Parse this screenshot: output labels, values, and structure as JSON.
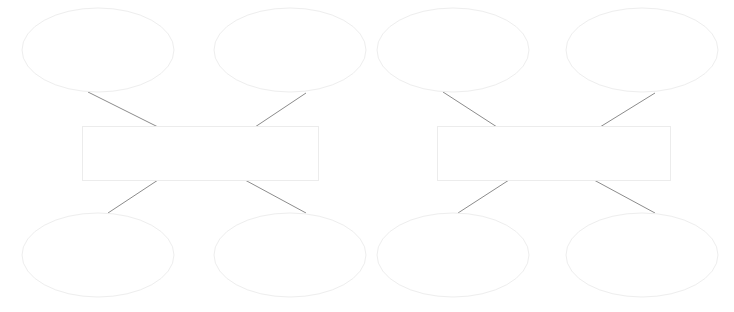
{
  "document": {
    "title": "Blank Concept Map Worksheet",
    "background_color": "#ffffff",
    "width": 734,
    "height": 312
  },
  "style": {
    "ellipse_stroke_color": "#eeeeee",
    "rectangle_stroke_color": "#ececec",
    "connector_stroke_color": "#8c8c8c",
    "shape_fill_color": "#ffffff",
    "stroke_width": 1
  },
  "diagram": {
    "type": "concept-map",
    "group_count": 2,
    "groups": [
      {
        "id": "group-left",
        "center_box": {
          "name": "center-box-left",
          "label": "",
          "x": 82,
          "y": 126,
          "width": 236,
          "height": 54
        },
        "nodes": [
          {
            "name": "ellipse-left-top-1",
            "label": "",
            "cx": 98,
            "cy": 50,
            "rx": 76,
            "ry": 42
          },
          {
            "name": "ellipse-left-top-2",
            "label": "",
            "cx": 290,
            "cy": 50,
            "rx": 76,
            "ry": 42
          },
          {
            "name": "ellipse-left-bottom-1",
            "label": "",
            "cx": 98,
            "cy": 255,
            "rx": 76,
            "ry": 42
          },
          {
            "name": "ellipse-left-bottom-2",
            "label": "",
            "cx": 290,
            "cy": 255,
            "rx": 76,
            "ry": 42
          }
        ],
        "connectors": [
          {
            "name": "connector-left-top-1",
            "x1": 88,
            "y1": 92,
            "x2": 158,
            "y2": 127
          },
          {
            "name": "connector-left-top-2",
            "x1": 255,
            "y1": 127,
            "x2": 306,
            "y2": 93
          },
          {
            "name": "connector-left-bottom-1",
            "x1": 108,
            "y1": 213,
            "x2": 158,
            "y2": 180
          },
          {
            "name": "connector-left-bottom-2",
            "x1": 245,
            "y1": 180,
            "x2": 306,
            "y2": 213
          }
        ]
      },
      {
        "id": "group-right",
        "center_box": {
          "name": "center-box-right",
          "label": "",
          "x": 437,
          "y": 126,
          "width": 233,
          "height": 54
        },
        "nodes": [
          {
            "name": "ellipse-right-top-1",
            "label": "",
            "cx": 453,
            "cy": 50,
            "rx": 76,
            "ry": 42
          },
          {
            "name": "ellipse-right-top-2",
            "label": "",
            "cx": 642,
            "cy": 50,
            "rx": 76,
            "ry": 42
          },
          {
            "name": "ellipse-right-bottom-1",
            "label": "",
            "cx": 453,
            "cy": 255,
            "rx": 76,
            "ry": 42
          },
          {
            "name": "ellipse-right-bottom-2",
            "label": "",
            "cx": 642,
            "cy": 255,
            "rx": 76,
            "ry": 42
          }
        ],
        "connectors": [
          {
            "name": "connector-right-top-1",
            "x1": 443,
            "y1": 92,
            "x2": 497,
            "y2": 127
          },
          {
            "name": "connector-right-top-2",
            "x1": 600,
            "y1": 127,
            "x2": 655,
            "y2": 93
          },
          {
            "name": "connector-right-bottom-1",
            "x1": 458,
            "y1": 213,
            "x2": 509,
            "y2": 180
          },
          {
            "name": "connector-right-bottom-2",
            "x1": 594,
            "y1": 180,
            "x2": 655,
            "y2": 213
          }
        ]
      }
    ]
  }
}
